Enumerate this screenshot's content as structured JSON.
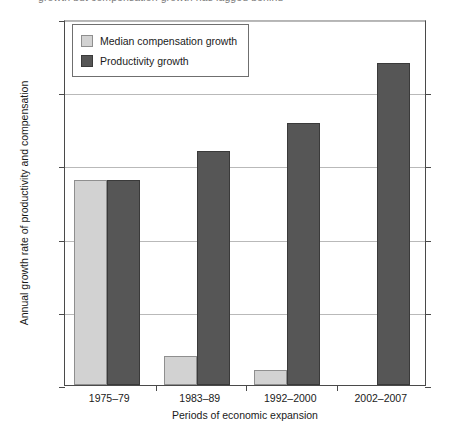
{
  "chart_data": {
    "type": "bar",
    "title": "",
    "xlabel": "Periods of economic expansion",
    "ylabel": "Annual growth rate of productivity and compensation",
    "categories": [
      "1975–79",
      "1983–89",
      "1992–2000",
      "2002–2007"
    ],
    "series": [
      {
        "name": "Median compensation growth",
        "color": "#d2d2d2",
        "values": [
          1.4,
          0.2,
          0.1,
          0.0
        ]
      },
      {
        "name": "Productivity growth",
        "color": "#565656",
        "values": [
          1.4,
          1.6,
          1.79,
          2.2
        ]
      }
    ],
    "ylim": [
      0.0,
      2.5
    ],
    "ytick_values": [
      0.0,
      0.5,
      1.0,
      1.5,
      2.0,
      2.5
    ],
    "ytick_labels": [
      "0.0%",
      "0.5%",
      "1.0%",
      "1.5%",
      "2.0%",
      "2.5%"
    ],
    "grid": true,
    "grid_axis": "y",
    "legend_position": "top-left"
  },
  "legend": {
    "items": [
      {
        "label": "Median compensation growth",
        "swatch": "light"
      },
      {
        "label": "Productivity growth",
        "swatch": "dark"
      }
    ]
  },
  "top_caption": "growth but compensation growth has lagged behind"
}
